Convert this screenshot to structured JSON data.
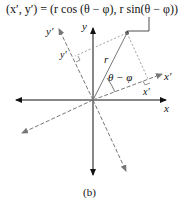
{
  "formula": "(x′, y′) = (r cos (θ − φ), r sin(θ − φ))",
  "labels": {
    "x": "x",
    "y": "y",
    "x_prime_axis": "x′",
    "y_prime_axis": "y′",
    "x_prime_proj": "x′",
    "y_prime_proj": "y′",
    "r": "r",
    "angle": "θ − φ"
  },
  "caption": "(b)",
  "colors": {
    "axis": "#111111",
    "rotated_axis": "#777777",
    "guide": "#888888"
  }
}
